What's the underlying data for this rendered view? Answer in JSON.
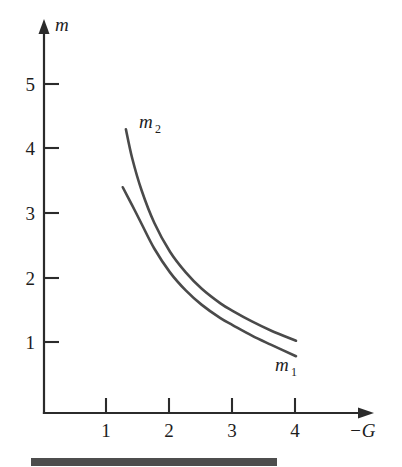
{
  "chart_data": {
    "type": "line",
    "title": "",
    "xlabel": "−G",
    "ylabel": "m",
    "xlim": [
      0,
      5.2
    ],
    "ylim": [
      0,
      5.9
    ],
    "xticks": [
      1,
      2,
      3,
      4
    ],
    "xtick_labels": [
      "1",
      "2",
      "3",
      "4"
    ],
    "yticks": [
      1,
      2,
      3,
      4,
      5
    ],
    "ytick_labels": [
      "1",
      "2",
      "3",
      "4",
      "5"
    ],
    "grid": false,
    "legend": "inline-annotations",
    "series": [
      {
        "name": "m2",
        "label": "m",
        "label_sub": "2",
        "color": "#4a4a4a",
        "x": [
          1.3,
          1.4,
          1.55,
          1.75,
          2.0,
          2.25,
          2.5,
          2.8,
          3.0,
          3.3,
          3.6,
          4.0
        ],
        "y": [
          4.4,
          3.95,
          3.45,
          2.95,
          2.5,
          2.18,
          1.93,
          1.7,
          1.58,
          1.42,
          1.28,
          1.12
        ]
      },
      {
        "name": "m1",
        "label": "m",
        "label_sub": "1",
        "color": "#4a4a4a",
        "x": [
          1.25,
          1.4,
          1.55,
          1.75,
          2.0,
          2.25,
          2.5,
          2.8,
          3.0,
          3.3,
          3.6,
          4.0
        ],
        "y": [
          3.5,
          3.22,
          2.93,
          2.55,
          2.18,
          1.9,
          1.68,
          1.47,
          1.36,
          1.2,
          1.06,
          0.88
        ]
      }
    ],
    "annotations": [
      {
        "text": "m",
        "sub": "2",
        "x": 1.55,
        "y": 4.45
      },
      {
        "text": "m",
        "sub": "1",
        "x": 3.7,
        "y": 0.52
      }
    ]
  },
  "axes": {
    "y_axis_title": "m",
    "x_axis_title": "−G",
    "y_tick_labels": [
      "5",
      "4",
      "3",
      "2",
      "1"
    ],
    "x_tick_labels": [
      "1",
      "2",
      "3",
      "4"
    ],
    "axis_color": "#2b2b2b",
    "curve_color": "#4a4a4a"
  },
  "footer": {
    "bar_color": "#4d4d4d"
  }
}
